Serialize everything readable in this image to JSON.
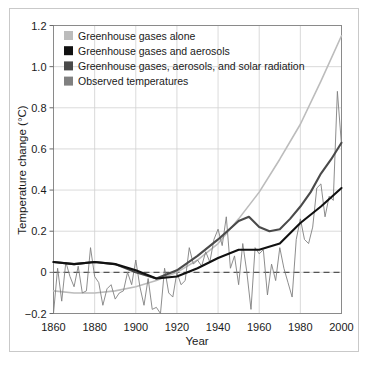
{
  "chart_data": {
    "type": "line",
    "title": "",
    "xlabel": "Year",
    "ylabel": "Temperature change (°C)",
    "xlim": [
      1860,
      2000
    ],
    "ylim": [
      -0.2,
      1.2
    ],
    "xticks": [
      1860,
      1880,
      1900,
      1920,
      1940,
      1960,
      1980,
      2000
    ],
    "yticks": [
      -0.2,
      0,
      0.2,
      0.4,
      0.6,
      0.8,
      1.0,
      1.2
    ],
    "xtick_labels": [
      "1860",
      "1880",
      "1900",
      "1920",
      "1940",
      "1960",
      "1980",
      "2000"
    ],
    "ytick_labels": [
      "−0.2",
      "0",
      "0.2",
      "0.4",
      "0.6",
      "0.8",
      "1.0",
      "1.2"
    ],
    "grid": true,
    "legend_position": "top-left",
    "zero_reference_line": {
      "value": 0,
      "style": "dashed",
      "color": "#555555"
    },
    "series": [
      {
        "name": "Greenhouse gases alone",
        "color": "#bcbcbc",
        "width": 1.6,
        "x": [
          1860,
          1870,
          1880,
          1890,
          1900,
          1910,
          1920,
          1930,
          1940,
          1950,
          1960,
          1970,
          1980,
          1990,
          2000
        ],
        "values": [
          -0.09,
          -0.1,
          -0.1,
          -0.09,
          -0.07,
          -0.04,
          0.0,
          0.06,
          0.14,
          0.26,
          0.39,
          0.55,
          0.72,
          0.93,
          1.15
        ]
      },
      {
        "name": "Greenhouse gases and aerosols",
        "color": "#111111",
        "width": 2.1,
        "x": [
          1860,
          1870,
          1880,
          1890,
          1900,
          1910,
          1920,
          1930,
          1940,
          1950,
          1960,
          1970,
          1980,
          1990,
          2000
        ],
        "values": [
          0.05,
          0.04,
          0.05,
          0.04,
          0.01,
          -0.03,
          -0.02,
          0.02,
          0.07,
          0.11,
          0.11,
          0.14,
          0.24,
          0.32,
          0.41
        ]
      },
      {
        "name": "Greenhouse gases, aerosols, and solar radiation",
        "color": "#4a4a4a",
        "width": 2.1,
        "x": [
          1860,
          1870,
          1880,
          1890,
          1900,
          1910,
          1920,
          1930,
          1940,
          1950,
          1955,
          1960,
          1965,
          1970,
          1975,
          1980,
          1985,
          1990,
          1995,
          2000
        ],
        "values": [
          0.05,
          0.04,
          0.05,
          0.04,
          0.0,
          -0.03,
          0.01,
          0.08,
          0.16,
          0.25,
          0.27,
          0.22,
          0.2,
          0.21,
          0.26,
          0.32,
          0.39,
          0.48,
          0.55,
          0.63
        ]
      },
      {
        "name": "Observed temperatures",
        "color": "#808080",
        "width": 0.9,
        "x": [
          1860,
          1862,
          1864,
          1866,
          1868,
          1870,
          1872,
          1874,
          1876,
          1878,
          1880,
          1882,
          1884,
          1886,
          1888,
          1890,
          1892,
          1894,
          1896,
          1898,
          1900,
          1902,
          1904,
          1906,
          1908,
          1910,
          1912,
          1914,
          1916,
          1918,
          1920,
          1922,
          1924,
          1926,
          1928,
          1930,
          1932,
          1934,
          1936,
          1938,
          1940,
          1942,
          1944,
          1946,
          1948,
          1950,
          1952,
          1954,
          1956,
          1958,
          1960,
          1962,
          1964,
          1966,
          1968,
          1970,
          1972,
          1974,
          1976,
          1978,
          1980,
          1982,
          1984,
          1986,
          1988,
          1990,
          1992,
          1994,
          1996,
          1998,
          2000
        ],
        "values": [
          -0.2,
          0.02,
          -0.14,
          0.05,
          -0.02,
          -0.07,
          0.03,
          -0.1,
          -0.09,
          0.12,
          -0.02,
          -0.05,
          -0.16,
          -0.08,
          -0.06,
          -0.13,
          -0.1,
          -0.09,
          0.0,
          -0.06,
          0.06,
          -0.07,
          -0.16,
          -0.03,
          -0.18,
          -0.17,
          -0.2,
          0.02,
          -0.1,
          -0.12,
          0.0,
          -0.06,
          -0.04,
          0.12,
          0.04,
          0.06,
          0.03,
          0.1,
          0.05,
          0.16,
          0.21,
          0.13,
          0.27,
          0.02,
          0.08,
          -0.06,
          0.14,
          0.0,
          -0.18,
          0.12,
          0.09,
          0.11,
          -0.11,
          0.04,
          -0.04,
          0.12,
          0.02,
          -0.05,
          -0.12,
          0.16,
          0.26,
          0.16,
          0.14,
          0.22,
          0.41,
          0.43,
          0.27,
          0.37,
          0.35,
          0.88,
          0.62
        ]
      }
    ],
    "legend": [
      {
        "label": "Greenhouse gases alone",
        "color": "#bcbcbc"
      },
      {
        "label": "Greenhouse gases and aerosols",
        "color": "#111111"
      },
      {
        "label": "Greenhouse gases, aerosols, and solar radiation",
        "color": "#4a4a4a"
      },
      {
        "label": "Observed temperatures",
        "color": "#808080"
      }
    ]
  }
}
